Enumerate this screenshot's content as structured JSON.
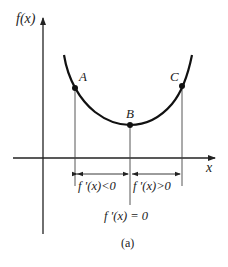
{
  "diagram": {
    "y_axis_label": "f(x)",
    "x_axis_label": "x",
    "points": [
      {
        "name": "A",
        "label": "A"
      },
      {
        "name": "B",
        "label": "B"
      },
      {
        "name": "C",
        "label": "C"
      }
    ],
    "left_interval_label": "f '(x)<0",
    "right_interval_label": "f '(x)>0",
    "minimum_label": "f '(x) = 0",
    "caption": "(a)"
  },
  "colors": {
    "curve": "#111111",
    "axis": "#222222",
    "guide": "#444444"
  }
}
